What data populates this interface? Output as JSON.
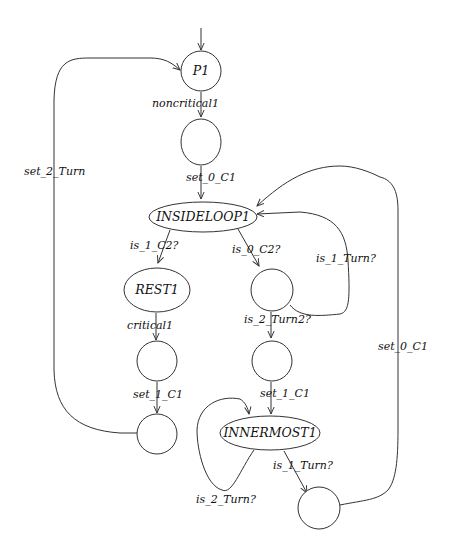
{
  "diagram": {
    "type": "state-machine",
    "nodes": {
      "p1": {
        "label": "P1"
      },
      "s_after_noncritical": {
        "label": ""
      },
      "insideloop1": {
        "label": "INSIDELOOP1"
      },
      "rest1": {
        "label": "REST1"
      },
      "s_after_critical": {
        "label": ""
      },
      "s_after_set1": {
        "label": ""
      },
      "s_after_is0c2": {
        "label": ""
      },
      "s_after_is2turn2": {
        "label": ""
      },
      "innermost1": {
        "label": "INNERMOST1"
      },
      "s_after_is1turn": {
        "label": ""
      }
    },
    "edges": {
      "initial": {
        "from": "",
        "to": "p1",
        "label": ""
      },
      "noncritical1": {
        "from": "p1",
        "to": "s_after_noncritical",
        "label": "noncritical1"
      },
      "set_0_C1_a": {
        "from": "s_after_noncritical",
        "to": "insideloop1",
        "label": "set_0_C1"
      },
      "is_1_C2": {
        "from": "insideloop1",
        "to": "rest1",
        "label": "is_1_C2?"
      },
      "is_0_C2": {
        "from": "insideloop1",
        "to": "s_after_is0c2",
        "label": "is_0_C2?"
      },
      "is_1_Turn_loop": {
        "from": "s_after_is0c2",
        "to": "insideloop1",
        "label": "is_1_Turn?"
      },
      "critical1": {
        "from": "rest1",
        "to": "s_after_critical",
        "label": "critical1"
      },
      "set_1_C1_a": {
        "from": "s_after_critical",
        "to": "s_after_set1",
        "label": "set_1_C1"
      },
      "set_2_Turn": {
        "from": "s_after_set1",
        "to": "p1",
        "label": "set_2_Turn"
      },
      "is_2_Turn2": {
        "from": "s_after_is0c2",
        "to": "s_after_is2turn2",
        "label": "is_2_Turn2?"
      },
      "set_1_C1_b": {
        "from": "s_after_is2turn2",
        "to": "innermost1",
        "label": "set_1_C1"
      },
      "is_2_Turn_loop": {
        "from": "innermost1",
        "to": "innermost1",
        "label": "is_2_Turn?"
      },
      "is_1_Turn": {
        "from": "innermost1",
        "to": "s_after_is1turn",
        "label": "is_1_Turn?"
      },
      "set_0_C1_b": {
        "from": "s_after_is1turn",
        "to": "insideloop1",
        "label": "set_0_C1"
      }
    },
    "colors": {
      "stroke": "#333333",
      "background": "#ffffff",
      "text": "#111111"
    }
  }
}
